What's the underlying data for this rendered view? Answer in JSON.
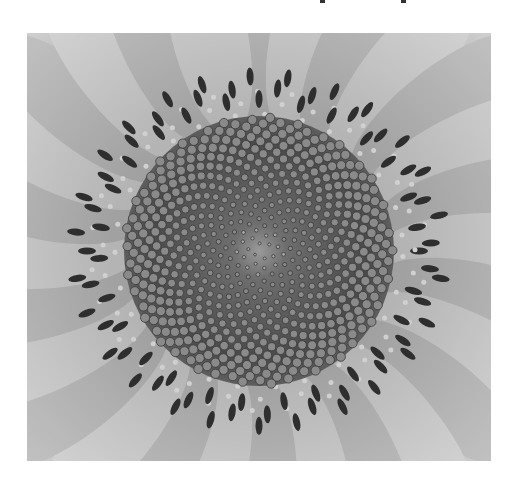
{
  "figure": {
    "alt": "Grayscale close-up photograph of a sunflower head showing spiral seed pattern surrounded by florets and petals",
    "tone": "grayscale",
    "colors": {
      "background": "#ffffff",
      "petal_light": "#c8c8c8",
      "petal_mid": "#9a9a9a",
      "disk_dark": "#3a3a3a",
      "seed": "#7a7a7a",
      "center": "#8c8c8c"
    }
  }
}
